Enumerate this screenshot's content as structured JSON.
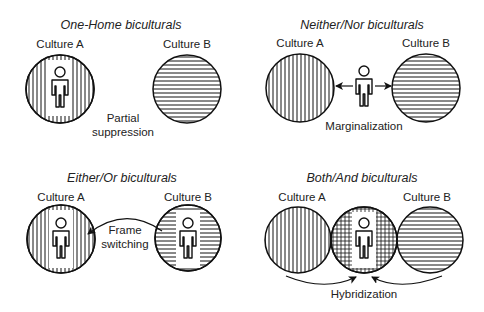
{
  "panels": [
    {
      "title": "One-Home biculturals",
      "culture_a": "Culture A",
      "culture_b": "Culture B",
      "process_line1": "Partial",
      "process_line2": "suppression"
    },
    {
      "title": "Neither/Nor biculturals",
      "culture_a": "Culture A",
      "culture_b": "Culture B",
      "process_line1": "Marginalization"
    },
    {
      "title": "Either/Or biculturals",
      "culture_a": "Culture A",
      "culture_b": "Culture B",
      "process_line1": "Frame",
      "process_line2": "switching"
    },
    {
      "title": "Both/And biculturals",
      "culture_a": "Culture A",
      "culture_b": "Culture B",
      "process_line1": "Hybridization"
    }
  ],
  "icons": {
    "person": "person-icon",
    "vertical_hatch": "culture-a-pattern",
    "horizontal_hatch": "culture-b-pattern",
    "grid_hatch": "hybrid-pattern"
  },
  "colors": {
    "stroke": "#111111",
    "text": "#222222",
    "background": "#ffffff"
  }
}
